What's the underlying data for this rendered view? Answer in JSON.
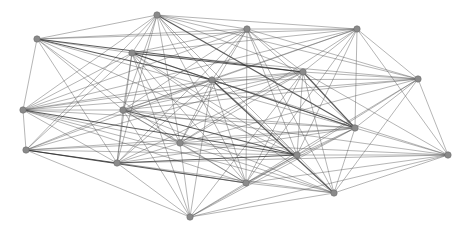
{
  "diagram": {
    "type": "network-graph",
    "node_color": "#8a8a8a",
    "edge_color": "#555555",
    "node_radius": 3.2,
    "nodes": [
      {
        "id": "A",
        "x": 157,
        "y": 15
      },
      {
        "id": "B",
        "x": 37,
        "y": 39
      },
      {
        "id": "C",
        "x": 132,
        "y": 53
      },
      {
        "id": "D",
        "x": 247,
        "y": 29
      },
      {
        "id": "E",
        "x": 357,
        "y": 29
      },
      {
        "id": "F",
        "x": 303,
        "y": 72
      },
      {
        "id": "G",
        "x": 418,
        "y": 79
      },
      {
        "id": "H",
        "x": 212,
        "y": 80
      },
      {
        "id": "I",
        "x": 23,
        "y": 110
      },
      {
        "id": "J",
        "x": 123,
        "y": 110
      },
      {
        "id": "K",
        "x": 355,
        "y": 128
      },
      {
        "id": "L",
        "x": 26,
        "y": 150
      },
      {
        "id": "M",
        "x": 117,
        "y": 163
      },
      {
        "id": "N",
        "x": 180,
        "y": 143
      },
      {
        "id": "O",
        "x": 297,
        "y": 155
      },
      {
        "id": "P",
        "x": 246,
        "y": 183
      },
      {
        "id": "Q",
        "x": 448,
        "y": 155
      },
      {
        "id": "R",
        "x": 190,
        "y": 217
      },
      {
        "id": "S",
        "x": 334,
        "y": 193
      }
    ],
    "edges": [
      [
        "A",
        "B"
      ],
      [
        "A",
        "C"
      ],
      [
        "A",
        "D"
      ],
      [
        "A",
        "E"
      ],
      [
        "A",
        "F"
      ],
      [
        "A",
        "H"
      ],
      [
        "A",
        "I"
      ],
      [
        "A",
        "J"
      ],
      [
        "A",
        "K"
      ],
      [
        "A",
        "L"
      ],
      [
        "A",
        "M"
      ],
      [
        "A",
        "N"
      ],
      [
        "A",
        "O"
      ],
      [
        "A",
        "P"
      ],
      [
        "A",
        "G"
      ],
      [
        "B",
        "C"
      ],
      [
        "B",
        "D"
      ],
      [
        "B",
        "F"
      ],
      [
        "B",
        "H"
      ],
      [
        "B",
        "I"
      ],
      [
        "B",
        "J"
      ],
      [
        "B",
        "K"
      ],
      [
        "B",
        "M"
      ],
      [
        "B",
        "N"
      ],
      [
        "B",
        "O"
      ],
      [
        "B",
        "E"
      ],
      [
        "C",
        "D"
      ],
      [
        "C",
        "E"
      ],
      [
        "C",
        "F"
      ],
      [
        "C",
        "G"
      ],
      [
        "C",
        "H"
      ],
      [
        "C",
        "I"
      ],
      [
        "C",
        "J"
      ],
      [
        "C",
        "K"
      ],
      [
        "C",
        "L"
      ],
      [
        "C",
        "M"
      ],
      [
        "C",
        "N"
      ],
      [
        "C",
        "O"
      ],
      [
        "C",
        "P"
      ],
      [
        "C",
        "R"
      ],
      [
        "C",
        "S"
      ],
      [
        "D",
        "E"
      ],
      [
        "D",
        "F"
      ],
      [
        "D",
        "G"
      ],
      [
        "D",
        "H"
      ],
      [
        "D",
        "I"
      ],
      [
        "D",
        "J"
      ],
      [
        "D",
        "K"
      ],
      [
        "D",
        "M"
      ],
      [
        "D",
        "N"
      ],
      [
        "D",
        "O"
      ],
      [
        "D",
        "P"
      ],
      [
        "D",
        "S"
      ],
      [
        "E",
        "F"
      ],
      [
        "E",
        "G"
      ],
      [
        "E",
        "H"
      ],
      [
        "E",
        "J"
      ],
      [
        "E",
        "K"
      ],
      [
        "E",
        "N"
      ],
      [
        "E",
        "O"
      ],
      [
        "E",
        "P"
      ],
      [
        "E",
        "Q"
      ],
      [
        "E",
        "I"
      ],
      [
        "F",
        "G"
      ],
      [
        "F",
        "H"
      ],
      [
        "F",
        "I"
      ],
      [
        "F",
        "J"
      ],
      [
        "F",
        "K"
      ],
      [
        "F",
        "L"
      ],
      [
        "F",
        "M"
      ],
      [
        "F",
        "N"
      ],
      [
        "F",
        "O"
      ],
      [
        "F",
        "P"
      ],
      [
        "F",
        "Q"
      ],
      [
        "F",
        "R"
      ],
      [
        "F",
        "S"
      ],
      [
        "G",
        "H"
      ],
      [
        "G",
        "J"
      ],
      [
        "G",
        "K"
      ],
      [
        "G",
        "N"
      ],
      [
        "G",
        "O"
      ],
      [
        "G",
        "P"
      ],
      [
        "G",
        "Q"
      ],
      [
        "G",
        "S"
      ],
      [
        "G",
        "I"
      ],
      [
        "H",
        "I"
      ],
      [
        "H",
        "J"
      ],
      [
        "H",
        "K"
      ],
      [
        "H",
        "L"
      ],
      [
        "H",
        "M"
      ],
      [
        "H",
        "N"
      ],
      [
        "H",
        "O"
      ],
      [
        "H",
        "P"
      ],
      [
        "H",
        "R"
      ],
      [
        "H",
        "S"
      ],
      [
        "H",
        "Q"
      ],
      [
        "I",
        "J"
      ],
      [
        "I",
        "K"
      ],
      [
        "I",
        "L"
      ],
      [
        "I",
        "M"
      ],
      [
        "I",
        "N"
      ],
      [
        "I",
        "O"
      ],
      [
        "I",
        "P"
      ],
      [
        "I",
        "S"
      ],
      [
        "J",
        "K"
      ],
      [
        "J",
        "L"
      ],
      [
        "J",
        "M"
      ],
      [
        "J",
        "N"
      ],
      [
        "J",
        "O"
      ],
      [
        "J",
        "P"
      ],
      [
        "J",
        "Q"
      ],
      [
        "J",
        "R"
      ],
      [
        "J",
        "S"
      ],
      [
        "K",
        "L"
      ],
      [
        "K",
        "M"
      ],
      [
        "K",
        "N"
      ],
      [
        "K",
        "O"
      ],
      [
        "K",
        "P"
      ],
      [
        "K",
        "Q"
      ],
      [
        "K",
        "R"
      ],
      [
        "K",
        "S"
      ],
      [
        "L",
        "M"
      ],
      [
        "L",
        "N"
      ],
      [
        "L",
        "O"
      ],
      [
        "L",
        "P"
      ],
      [
        "L",
        "R"
      ],
      [
        "L",
        "K"
      ],
      [
        "M",
        "N"
      ],
      [
        "M",
        "O"
      ],
      [
        "M",
        "P"
      ],
      [
        "M",
        "R"
      ],
      [
        "M",
        "S"
      ],
      [
        "M",
        "Q"
      ],
      [
        "N",
        "O"
      ],
      [
        "N",
        "P"
      ],
      [
        "N",
        "R"
      ],
      [
        "N",
        "S"
      ],
      [
        "N",
        "Q"
      ],
      [
        "O",
        "P"
      ],
      [
        "O",
        "Q"
      ],
      [
        "O",
        "R"
      ],
      [
        "O",
        "S"
      ],
      [
        "P",
        "Q"
      ],
      [
        "P",
        "R"
      ],
      [
        "P",
        "S"
      ],
      [
        "Q",
        "R"
      ],
      [
        "Q",
        "S"
      ],
      [
        "R",
        "S"
      ]
    ],
    "strong_edges": [
      [
        "B",
        "F"
      ],
      [
        "C",
        "K"
      ],
      [
        "A",
        "K"
      ],
      [
        "I",
        "O"
      ],
      [
        "L",
        "P"
      ],
      [
        "J",
        "O"
      ],
      [
        "C",
        "F"
      ],
      [
        "H",
        "S"
      ],
      [
        "L",
        "M"
      ],
      [
        "B",
        "H"
      ],
      [
        "M",
        "O"
      ],
      [
        "F",
        "K"
      ]
    ]
  }
}
